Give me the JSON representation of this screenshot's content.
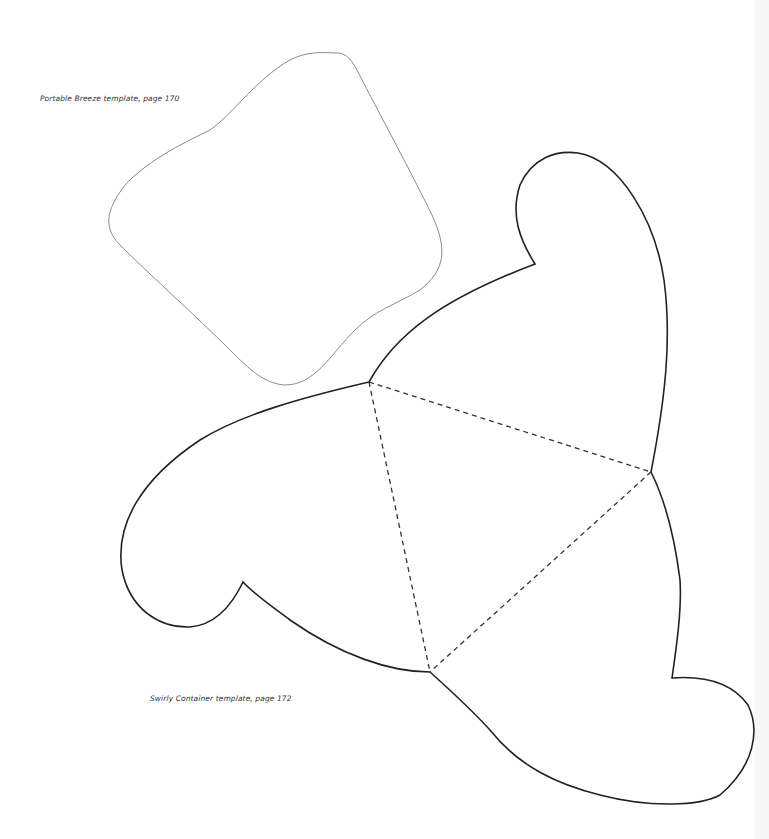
{
  "page": {
    "background": "#ffffff"
  },
  "templates": [
    {
      "id": "portable-breeze",
      "caption": "Portable Breeze template, page 170",
      "outline_color": "#888888",
      "line_style": "solid-thin"
    },
    {
      "id": "swirly-container",
      "caption": "Swirly Container template, page 172",
      "outline_color": "#222222",
      "fold_line_color": "#333333",
      "line_style": "solid-cut-with-dashed-folds"
    }
  ]
}
